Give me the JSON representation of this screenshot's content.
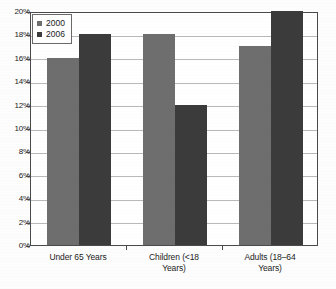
{
  "chart_data": {
    "type": "bar",
    "title": "",
    "xlabel": "",
    "ylabel": "",
    "categories": [
      "Under 65 Years",
      "Children (<18 Years)",
      "Adults (18–64 Years)"
    ],
    "series": [
      {
        "name": "2000",
        "color": "#6e6e6e",
        "values": [
          16,
          18,
          17
        ]
      },
      {
        "name": "2006",
        "color": "#3b3b3b",
        "values": [
          18,
          12,
          20
        ]
      }
    ],
    "ylim": [
      0,
      20
    ],
    "ytick_labels": [
      "20%",
      "18%",
      "16%",
      "14%",
      "12%",
      "10%",
      "8%",
      "6%",
      "4%",
      "2%",
      "0%"
    ],
    "ytick_values": [
      20,
      18,
      16,
      14,
      12,
      10,
      8,
      6,
      4,
      2,
      0
    ],
    "grid": true,
    "legend_position": "top-left-inside",
    "value_suffix": "%"
  },
  "legend": {
    "entries": [
      {
        "label": "2000"
      },
      {
        "label": "2006"
      }
    ]
  },
  "categories_wrapped": [
    [
      "Under 65 Years"
    ],
    [
      "Children (<18",
      "Years)"
    ],
    [
      "Adults (18–64",
      "Years)"
    ]
  ]
}
